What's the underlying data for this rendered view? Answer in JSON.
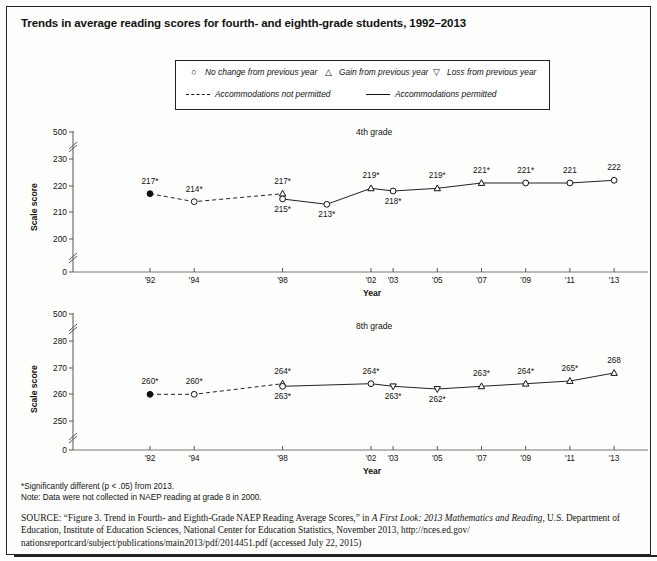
{
  "title": "Trends in average reading scores for fourth- and eighth-grade students, 1992–2013",
  "legend": {
    "markers": [
      {
        "symbol": "○",
        "label": "No change from previous year",
        "name": "no-change"
      },
      {
        "symbol": "△",
        "label": "Gain from previous year",
        "name": "gain"
      },
      {
        "symbol": "▽",
        "label": "Loss from previous year",
        "name": "loss"
      }
    ],
    "lines": [
      {
        "style": "dashed",
        "label": "Accommodations not permitted"
      },
      {
        "style": "solid",
        "label": "Accommodations permitted"
      }
    ]
  },
  "notes": [
    "*Significantly different (p < .05) from 2013.",
    "Note: Data were not collected in NAEP reading at grade 8 in 2000."
  ],
  "source": {
    "lead": "SOURCE:",
    "quote": "“Figure 3. Trend in Fourth- and Eighth-Grade NAEP Reading Average Scores,”",
    "in_word": " in ",
    "italic_title": "A First Look: 2013 Mathematics and Reading,",
    "rest": "U.S. Department of Education, Institute of Education Sciences, National Center for Education Statistics, November 2013, http://nces.ed.gov/ nationsreportcard/subject/publications/main2013/pdf/2014451.pdf (accessed July 22, 2015)"
  },
  "chart_data": [
    {
      "type": "line",
      "name": "grade4",
      "title": "4th grade",
      "xlabel": "Year",
      "ylabel": "Scale score",
      "ylim": [
        200,
        230
      ],
      "ytick_labels": [
        "500",
        "230",
        "220",
        "210",
        "200",
        "0"
      ],
      "axis_breaks": 2,
      "x_categories": [
        "'92",
        "'94",
        "'98",
        "'02",
        "'03",
        "'05",
        "'07",
        "'09",
        "'11",
        "'13"
      ],
      "x_years": [
        1992,
        1994,
        1998,
        2002,
        2003,
        2005,
        2007,
        2009,
        2011,
        2013
      ],
      "series": [
        {
          "name": "Accommodations not permitted",
          "style": "dashed",
          "points": [
            {
              "x": 1992,
              "y": 217,
              "label": "217*",
              "marker": "filled-circle",
              "label_pos": "above"
            },
            {
              "x": 1994,
              "y": 214,
              "label": "214*",
              "marker": "circle",
              "label_pos": "above"
            },
            {
              "x": 1998,
              "y": 217,
              "label": "217*",
              "marker": "triangle-up",
              "label_pos": "above"
            }
          ]
        },
        {
          "name": "Accommodations permitted",
          "style": "solid",
          "points": [
            {
              "x": 1998,
              "y": 215,
              "label": "215*",
              "marker": "circle",
              "label_pos": "below"
            },
            {
              "x": 2000,
              "y": 213,
              "label": "213*",
              "marker": "circle",
              "label_pos": "below"
            },
            {
              "x": 2002,
              "y": 219,
              "label": "219*",
              "marker": "triangle-up",
              "label_pos": "above"
            },
            {
              "x": 2003,
              "y": 218,
              "label": "218*",
              "marker": "circle",
              "label_pos": "below"
            },
            {
              "x": 2005,
              "y": 219,
              "label": "219*",
              "marker": "triangle-up",
              "label_pos": "above"
            },
            {
              "x": 2007,
              "y": 221,
              "label": "221*",
              "marker": "triangle-up",
              "label_pos": "above"
            },
            {
              "x": 2009,
              "y": 221,
              "label": "221*",
              "marker": "circle",
              "label_pos": "above"
            },
            {
              "x": 2011,
              "y": 221,
              "label": "221",
              "marker": "circle",
              "label_pos": "above"
            },
            {
              "x": 2013,
              "y": 222,
              "label": "222",
              "marker": "circle",
              "label_pos": "above"
            }
          ]
        }
      ]
    },
    {
      "type": "line",
      "name": "grade8",
      "title": "8th grade",
      "xlabel": "Year",
      "ylabel": "Scale score",
      "ylim": [
        250,
        280
      ],
      "ytick_labels": [
        "500",
        "280",
        "270",
        "260",
        "250",
        "0"
      ],
      "axis_breaks": 2,
      "x_categories": [
        "'92",
        "'94",
        "'98",
        "'02",
        "'03",
        "'05",
        "'07",
        "'09",
        "'11",
        "'13"
      ],
      "x_years": [
        1992,
        1994,
        1998,
        2002,
        2003,
        2005,
        2007,
        2009,
        2011,
        2013
      ],
      "series": [
        {
          "name": "Accommodations not permitted",
          "style": "dashed",
          "points": [
            {
              "x": 1992,
              "y": 260,
              "label": "260*",
              "marker": "filled-circle",
              "label_pos": "above"
            },
            {
              "x": 1994,
              "y": 260,
              "label": "260*",
              "marker": "circle",
              "label_pos": "above"
            },
            {
              "x": 1998,
              "y": 264,
              "label": "264*",
              "marker": "triangle-up",
              "label_pos": "above"
            }
          ]
        },
        {
          "name": "Accommodations permitted",
          "style": "solid",
          "points": [
            {
              "x": 1998,
              "y": 263,
              "label": "263*",
              "marker": "circle",
              "label_pos": "below"
            },
            {
              "x": 2002,
              "y": 264,
              "label": "264*",
              "marker": "circle",
              "label_pos": "above"
            },
            {
              "x": 2003,
              "y": 263,
              "label": "263*",
              "marker": "triangle-down",
              "label_pos": "below"
            },
            {
              "x": 2005,
              "y": 262,
              "label": "262*",
              "marker": "triangle-down",
              "label_pos": "below"
            },
            {
              "x": 2007,
              "y": 263,
              "label": "263*",
              "marker": "triangle-up",
              "label_pos": "above"
            },
            {
              "x": 2009,
              "y": 264,
              "label": "264*",
              "marker": "triangle-up",
              "label_pos": "above"
            },
            {
              "x": 2011,
              "y": 265,
              "label": "265*",
              "marker": "triangle-up",
              "label_pos": "above"
            },
            {
              "x": 2013,
              "y": 268,
              "label": "268",
              "marker": "triangle-up",
              "label_pos": "above"
            }
          ]
        }
      ]
    }
  ]
}
